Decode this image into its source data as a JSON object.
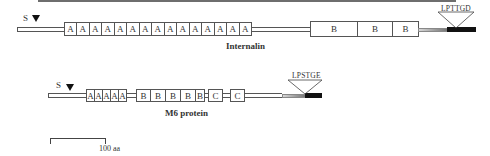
{
  "figure": {
    "type": "protein domain schematic",
    "top_rule": true
  },
  "proteins": [
    {
      "name": "Internalin",
      "signal_label": "S",
      "cleavage_icon": "triangle-down",
      "repeats": {
        "A": [
          "A",
          "A",
          "A",
          "A",
          "A",
          "A",
          "A",
          "A",
          "A",
          "A",
          "A",
          "A",
          "A",
          "A",
          "A"
        ],
        "B": [
          "B",
          "B",
          "B"
        ]
      },
      "anchor_motif": "LPTTGD"
    },
    {
      "name": "M6 protein",
      "signal_label": "S",
      "cleavage_icon": "triangle-down",
      "repeats": {
        "A": [
          "A",
          "A",
          "A",
          "A",
          "A"
        ],
        "B": [
          "B",
          "B",
          "B",
          "B",
          "B"
        ],
        "C": [
          "C",
          "C"
        ]
      },
      "anchor_motif": "LPSTGE"
    }
  ],
  "scale_bar": {
    "label": "100 aa"
  }
}
